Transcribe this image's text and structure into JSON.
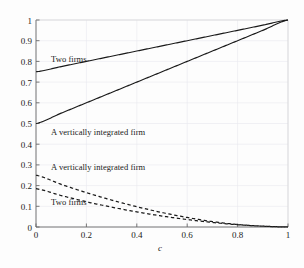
{
  "chart_data": {
    "type": "line",
    "title": "",
    "xlabel": "c",
    "ylabel": "",
    "xlim": [
      0,
      1
    ],
    "ylim": [
      0,
      1
    ],
    "grid": true,
    "legend_position": "inline-annotations",
    "x_ticks": [
      "0",
      "0.2",
      "0.4",
      "0.6",
      "0.8",
      "1"
    ],
    "x_tick_values": [
      0,
      0.2,
      0.4,
      0.6,
      0.8,
      1
    ],
    "y_ticks": [
      "0",
      "0.1",
      "0.2",
      "0.3",
      "0.4",
      "0.5",
      "0.6",
      "0.7",
      "0.8",
      "0.9",
      "1"
    ],
    "y_tick_values": [
      0,
      0.1,
      0.2,
      0.3,
      0.4,
      0.5,
      0.6,
      0.7,
      0.8,
      0.9,
      1.0
    ],
    "series": [
      {
        "name": "Two firms (solid upper)",
        "style": "solid",
        "color": "#1a1a1a",
        "x": [
          0,
          0.1,
          0.2,
          0.3,
          0.4,
          0.5,
          0.6,
          0.7,
          0.8,
          0.9,
          1
        ],
        "values": [
          0.75,
          0.775,
          0.8,
          0.825,
          0.85,
          0.875,
          0.9,
          0.925,
          0.95,
          0.975,
          1.0
        ]
      },
      {
        "name": "A vertically integrated firm (solid lower)",
        "style": "solid",
        "color": "#1a1a1a",
        "x": [
          0,
          0.1,
          0.2,
          0.3,
          0.4,
          0.5,
          0.6,
          0.7,
          0.8,
          0.9,
          1
        ],
        "values": [
          0.5,
          0.55,
          0.6,
          0.65,
          0.7,
          0.75,
          0.8,
          0.85,
          0.9,
          0.95,
          1.0
        ]
      },
      {
        "name": "A vertically integrated firm (dashed upper)",
        "style": "dashed",
        "color": "#1a1a1a",
        "x": [
          0,
          0.1,
          0.2,
          0.3,
          0.4,
          0.5,
          0.6,
          0.7,
          0.8,
          0.9,
          1
        ],
        "values": [
          0.25,
          0.206,
          0.166,
          0.13,
          0.098,
          0.07,
          0.046,
          0.026,
          0.012,
          0.004,
          0.0
        ]
      },
      {
        "name": "Two firms (dashed lower)",
        "style": "dashed",
        "color": "#1a1a1a",
        "x": [
          0,
          0.1,
          0.2,
          0.3,
          0.4,
          0.5,
          0.6,
          0.7,
          0.8,
          0.9,
          1
        ],
        "values": [
          0.185,
          0.152,
          0.122,
          0.096,
          0.073,
          0.053,
          0.036,
          0.022,
          0.011,
          0.004,
          0.0
        ]
      }
    ],
    "annotations": [
      {
        "text": "Two firms",
        "x": 0.06,
        "y": 0.805
      },
      {
        "text": "A vertically integrated firm",
        "x": 0.06,
        "y": 0.455
      },
      {
        "text": "A vertically integrated firm",
        "x": 0.06,
        "y": 0.283
      },
      {
        "text": "Two firms",
        "x": 0.06,
        "y": 0.118
      }
    ]
  },
  "axes": {
    "x_label": "c",
    "x_tick_0": "0",
    "x_tick_1": "0.2",
    "x_tick_2": "0.4",
    "x_tick_3": "0.6",
    "x_tick_4": "0.8",
    "x_tick_5": "1",
    "y_tick_0": "0",
    "y_tick_1": "0.1",
    "y_tick_2": "0.2",
    "y_tick_3": "0.3",
    "y_tick_4": "0.4",
    "y_tick_5": "0.5",
    "y_tick_6": "0.6",
    "y_tick_7": "0.7",
    "y_tick_8": "0.8",
    "y_tick_9": "0.9",
    "y_tick_10": "1"
  },
  "annotations": {
    "two_firms_solid": "Two firms",
    "vi_firm_solid": "A vertically integrated firm",
    "vi_firm_dashed": "A vertically integrated firm",
    "two_firms_dashed": "Two firms"
  },
  "colors": {
    "line": "#1a1a1a",
    "grid": "#e8e8ee",
    "axis": "#5a5a5a",
    "background": "#fdfdfd",
    "text": "#222222"
  }
}
